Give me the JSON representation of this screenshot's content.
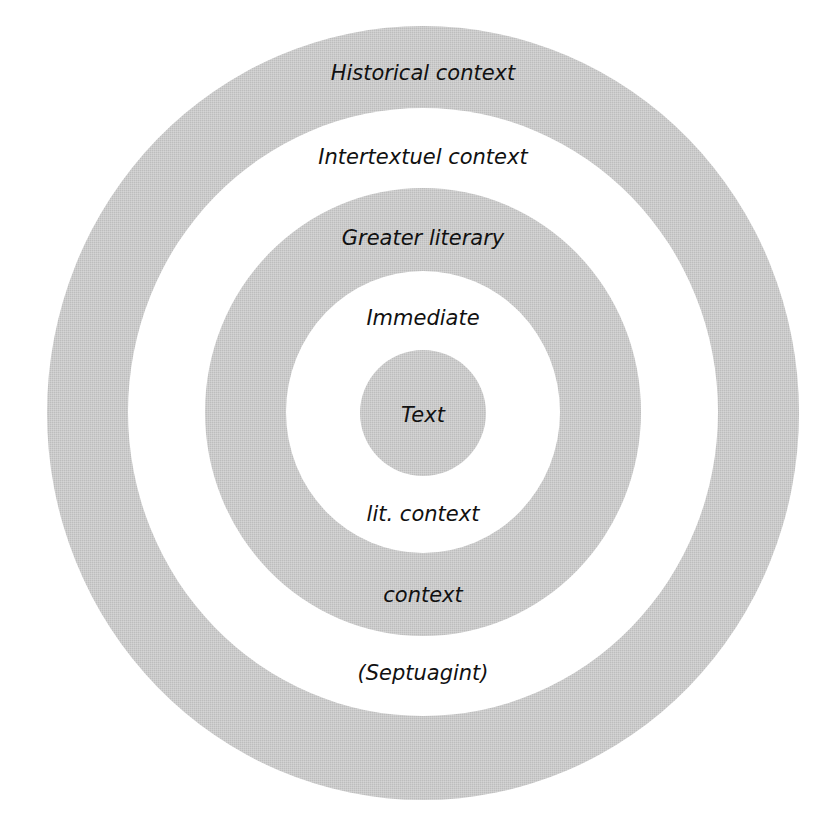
{
  "diagram": {
    "type": "concentric-circles",
    "center": {
      "x": 423,
      "y": 413
    },
    "colors": {
      "ring_gray": "#c9c9c9",
      "ring_white": "#ffffff",
      "text": "#111111"
    },
    "rings": [
      {
        "name": "historical-context",
        "rx": 376,
        "ry": 387,
        "fill": "#c9c9c9"
      },
      {
        "name": "intertextual-context",
        "rx": 295,
        "ry": 304,
        "fill": "#ffffff"
      },
      {
        "name": "greater-literary-context",
        "rx": 218,
        "ry": 224,
        "fill": "#c9c9c9"
      },
      {
        "name": "immediate-literary-context",
        "rx": 136,
        "ry": 140,
        "fill": "#ffffff"
      },
      {
        "name": "text",
        "rx": 63,
        "ry": 63,
        "fill": "#c9c9c9"
      }
    ],
    "labels": {
      "historical": "Historical context",
      "intertextual_top": "Intertextuel context",
      "intertextual_bottom": "(Septuagint)",
      "greater_top": "Greater literary",
      "greater_bottom": "context",
      "immediate_top": "Immediate",
      "immediate_bottom": "lit. context",
      "center": "Text"
    }
  }
}
